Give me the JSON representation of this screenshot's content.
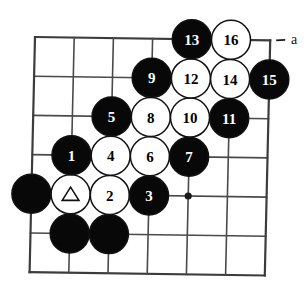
{
  "figure": {
    "kind": "go-board-diagram",
    "board": {
      "columns": 7,
      "rows": 7,
      "star_points": [
        {
          "col": 4,
          "row": 4
        }
      ],
      "line_color": "#4a4a4a",
      "background_color": "#ffffff"
    },
    "colors": {
      "black_stone": "#080808",
      "white_stone": "#ffffff",
      "stone_outline": "#111111",
      "black_label": "#ffffff",
      "white_label": "#000000"
    },
    "stones": [
      {
        "id": "stone-1",
        "label": "1",
        "color": "black",
        "col": 1,
        "row": 3
      },
      {
        "id": "stone-2",
        "label": "2",
        "color": "white",
        "col": 2,
        "row": 4
      },
      {
        "id": "stone-3",
        "label": "3",
        "color": "black",
        "col": 3,
        "row": 4
      },
      {
        "id": "stone-4",
        "label": "4",
        "color": "white",
        "col": 2,
        "row": 3
      },
      {
        "id": "stone-5",
        "label": "5",
        "color": "black",
        "col": 2,
        "row": 2
      },
      {
        "id": "stone-6",
        "label": "6",
        "color": "white",
        "col": 3,
        "row": 3
      },
      {
        "id": "stone-7",
        "label": "7",
        "color": "black",
        "col": 4,
        "row": 3
      },
      {
        "id": "stone-8",
        "label": "8",
        "color": "white",
        "col": 3,
        "row": 2
      },
      {
        "id": "stone-9",
        "label": "9",
        "color": "black",
        "col": 3,
        "row": 1
      },
      {
        "id": "stone-10",
        "label": "10",
        "color": "white",
        "col": 4,
        "row": 2
      },
      {
        "id": "stone-11",
        "label": "11",
        "color": "black",
        "col": 5,
        "row": 2
      },
      {
        "id": "stone-12",
        "label": "12",
        "color": "white",
        "col": 4,
        "row": 1
      },
      {
        "id": "stone-13",
        "label": "13",
        "color": "black",
        "col": 4,
        "row": 0
      },
      {
        "id": "stone-14",
        "label": "14",
        "color": "white",
        "col": 5,
        "row": 1
      },
      {
        "id": "stone-15",
        "label": "15",
        "color": "black",
        "col": 6,
        "row": 1
      },
      {
        "id": "stone-16",
        "label": "16",
        "color": "white",
        "col": 5,
        "row": 0
      }
    ],
    "marked_stones": [
      {
        "id": "stone-triangle",
        "mark": "triangle",
        "color": "white",
        "col": 1,
        "row": 4
      }
    ],
    "plain_stones": [
      {
        "id": "black-edge-stone",
        "color": "black",
        "col": 0,
        "row": 4
      },
      {
        "id": "black-lower-stone-a",
        "color": "black",
        "col": 1,
        "row": 5
      },
      {
        "id": "black-lower-stone-b",
        "color": "black",
        "col": 2,
        "row": 5
      }
    ],
    "point_labels": [
      {
        "id": "point-a",
        "label": "a",
        "col": 6,
        "row": 0
      }
    ]
  }
}
